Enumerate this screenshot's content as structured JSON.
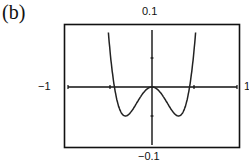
{
  "panel": {
    "label": "(b)"
  },
  "chart_data": {
    "type": "line",
    "title": "",
    "panel_label": "(b)",
    "xlabel": "",
    "ylabel": "",
    "xlim": [
      -1,
      1
    ],
    "ylim": [
      -0.1,
      0.1
    ],
    "x_tick_labels": {
      "min": "−1",
      "max": "1"
    },
    "y_tick_labels": {
      "max": "0.1",
      "min": "−0.1"
    },
    "grid": false,
    "legend": null,
    "series": [
      {
        "name": "f(x)",
        "x": [
          -0.55,
          -0.5,
          -0.45,
          -0.4,
          -0.35,
          -0.3,
          -0.25,
          -0.2,
          -0.15,
          -0.1,
          -0.05,
          0,
          0.05,
          0.1,
          0.15,
          0.2,
          0.25,
          0.3,
          0.35,
          0.4,
          0.45,
          0.5,
          0.55
        ],
        "y": [
          0.1,
          0.063,
          0.0,
          -0.032,
          -0.048,
          -0.05,
          -0.043,
          -0.032,
          -0.02,
          -0.0095,
          -0.0025,
          0,
          -0.0025,
          -0.0095,
          -0.02,
          -0.032,
          -0.043,
          -0.05,
          -0.048,
          -0.032,
          0.0,
          0.063,
          0.1
        ]
      }
    ]
  },
  "labels": {
    "ymax": "0.1",
    "ymin": "−0.1",
    "xmin": "−1",
    "xmax": "1"
  }
}
